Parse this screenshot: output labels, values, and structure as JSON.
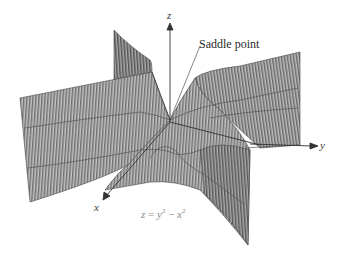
{
  "figure": {
    "equation": {
      "lhs": "z",
      "eq": " = ",
      "term1": "y",
      "exp1": "2",
      "minus": " − ",
      "term2": "x",
      "exp2": "2"
    },
    "annotation": "Saddle point",
    "axes": {
      "x": "x",
      "y": "y",
      "z": "z"
    },
    "colors": {
      "surface_fill": "#b9b9b9",
      "hatch_line": "#4a4a4a",
      "axis": "#333333",
      "text": "#333333",
      "equation_text": "#8a8a8a"
    }
  }
}
